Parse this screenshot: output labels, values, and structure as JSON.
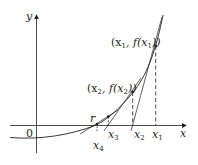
{
  "diagram": {
    "colors": {
      "ink": "#231f20",
      "background": "#ffffff"
    },
    "axes": {
      "x_label": "x",
      "y_label": "y",
      "origin_label": "0"
    },
    "root_label": "r",
    "points": [
      {
        "name": "x1",
        "label": "x",
        "sub": "1",
        "point_label_pre": "(x",
        "point_label_sub": "1",
        "point_label_post": ", f(x",
        "point_label_sub2": "1",
        "point_label_end": "))"
      },
      {
        "name": "x2",
        "label": "x",
        "sub": "2",
        "point_label_pre": "(x",
        "point_label_sub": "2",
        "point_label_post": ", f(x",
        "point_label_sub2": "2",
        "point_label_end": "))"
      },
      {
        "name": "x3",
        "label": "x",
        "sub": "3"
      },
      {
        "name": "x4",
        "label": "x",
        "sub": "4"
      }
    ]
  }
}
